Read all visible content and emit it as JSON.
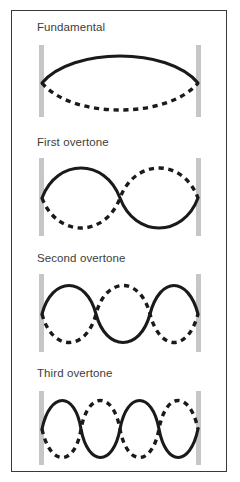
{
  "figure": {
    "background_color": "#ffffff",
    "border_color": "#3a3a3a",
    "wall_color": "#c6c6c6",
    "curve_color": "#1a1a1a",
    "label_color": "#3d3d3d"
  },
  "panels": [
    {
      "label": "Fundamental",
      "harmonic": 1,
      "half_wavelengths": 1,
      "solid_phase": "positive",
      "dashed_phase": "negative",
      "nodes": 2,
      "antinodes": 1
    },
    {
      "label": "First overtone",
      "harmonic": 2,
      "half_wavelengths": 2,
      "solid_phase": "positive",
      "dashed_phase": "negative",
      "nodes": 3,
      "antinodes": 2
    },
    {
      "label": "Second overtone",
      "harmonic": 3,
      "half_wavelengths": 3,
      "solid_phase": "positive",
      "dashed_phase": "negative",
      "nodes": 4,
      "antinodes": 3
    },
    {
      "label": "Third overtone",
      "harmonic": 4,
      "half_wavelengths": 4,
      "solid_phase": "positive",
      "dashed_phase": "negative",
      "nodes": 5,
      "antinodes": 4
    }
  ],
  "geometry": {
    "wall_left_x": 27,
    "wall_right_x": 189,
    "wall_width": 5,
    "string_span": 162
  }
}
